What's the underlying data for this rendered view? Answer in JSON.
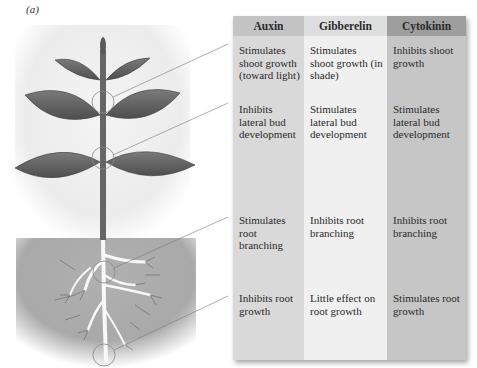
{
  "panel_label": "(a)",
  "table": {
    "columns": [
      {
        "name": "Auxin",
        "header_color": "#c4c4c4",
        "body_color": "#d9d9d9"
      },
      {
        "name": "Gibberelin",
        "header_color": "#dedede",
        "body_color": "#f0f0f0"
      },
      {
        "name": "Cytokinin",
        "header_color": "#9e9e9e",
        "body_color": "#c6c6c6"
      }
    ],
    "rows": [
      {
        "region": "shoot apex",
        "cells": [
          "Stimulates shoot growth (toward light)",
          "Stimulates shoot growth (in shade)",
          "Inhibits shoot growth"
        ]
      },
      {
        "region": "lateral bud",
        "cells": [
          "Inhibits lateral bud development",
          "Stimulates lateral bud development",
          "Stimulates lateral bud development"
        ]
      },
      {
        "region": "root branching",
        "cells": [
          "Stimulates root branching",
          "Inhibits root branching",
          "Inhibits root branching"
        ]
      },
      {
        "region": "root tip",
        "cells": [
          "Inhibits root growth",
          "Little effect on root growth",
          "Stimulates root growth"
        ]
      }
    ]
  },
  "illustration": {
    "subject": "plant with shoot and roots in soil",
    "callouts": [
      "shoot apex circle",
      "lateral bud circle",
      "root branching circle",
      "root tip circle"
    ]
  }
}
